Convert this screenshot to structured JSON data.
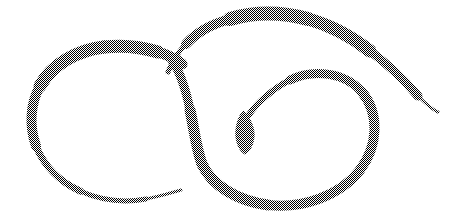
{
  "image": {
    "kind": "line-drawing",
    "subject": "calligraphic-flourish",
    "description": "Hand-drawn double-loop calligraphic flourish with a teardrop cusp",
    "width": 473,
    "height": 218,
    "background_color": "#ffffff",
    "ink_color": "#6b6b6b",
    "ink_rendering": "50% checkerboard halftone dither of dark gray on white",
    "stroke_count": 4
  },
  "strokes": [
    {
      "name": "left-loop",
      "label": "Left open loop",
      "color": "#6b6b6b",
      "start_point": [
        182,
        64
      ],
      "end_point": [
        181,
        190
      ],
      "extents": {
        "left": 30,
        "right": 186,
        "top": 46,
        "bottom": 201
      },
      "max_width": 13,
      "min_width": 2,
      "taper": "thick at top, tapering to a fine point at lower-right tip",
      "path": "M 182 64 C 168 52 140 45 112 47 C 78 49 48 66 36 92 C 24 118 30 150 48 172 C 68 196 106 206 140 200 C 160 196 174 192 181 190",
      "widths": [
        11,
        13,
        13,
        11,
        8,
        5,
        3,
        2
      ]
    },
    {
      "name": "outer-sweep",
      "label": "Large outer sweep with long tail",
      "color": "#6b6b6b",
      "start_point": [
        168,
        72
      ],
      "end_point": [
        438,
        111
      ],
      "extents": {
        "left": 168,
        "right": 438,
        "top": 12,
        "bottom": 112
      },
      "max_width": 14,
      "min_width": 1,
      "taper": "tapered at both ends, heaviest across the top arc",
      "path": "M 168 72 C 178 48 202 28 232 19 C 268 9 310 13 346 29 C 378 43 404 66 420 85 C 430 97 435 105 438 111",
      "widths": [
        4,
        9,
        14,
        14,
        11,
        6,
        1
      ]
    },
    {
      "name": "right-loop",
      "label": "Right loop spiralling into the cusp",
      "color": "#6b6b6b",
      "start_point": [
        172,
        60
      ],
      "end_point": [
        246,
        120
      ],
      "extents": {
        "left": 172,
        "right": 378,
        "top": 60,
        "bottom": 206
      },
      "max_width": 11,
      "min_width": 3,
      "taper": "moderately even weight, narrowing as it spirals inward to the cusp",
      "path": "M 172 60 C 186 84 190 118 196 144 C 204 174 230 198 268 205 C 308 212 348 192 366 162 C 382 134 380 102 358 86 C 334 68 300 70 278 88 C 260 102 250 112 246 120",
      "widths": [
        9,
        11,
        11,
        10,
        10,
        9,
        7,
        5,
        3
      ]
    },
    {
      "name": "teardrop-cusp",
      "label": "Teardrop cusp terminal",
      "color": "#6b6b6b",
      "center": [
        245,
        130
      ],
      "extents": {
        "left": 238,
        "right": 253,
        "top": 112,
        "bottom": 153
      },
      "max_width": 14,
      "shape": "filled oval tapering to a downward point",
      "path": "M 243 112 C 250 118 254 128 253 136 C 252 146 248 152 245 153 C 242 152 238 146 237 136 C 236 128 238 118 243 112 Z"
    }
  ]
}
